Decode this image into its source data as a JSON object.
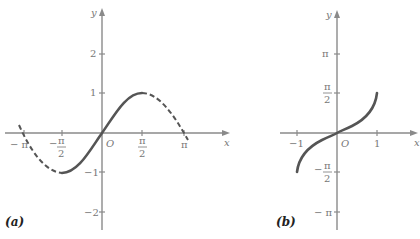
{
  "panels": [
    {
      "id": "a",
      "label": "(a)",
      "axes": {
        "x_label": "x",
        "y_label": "y",
        "origin_label": "O"
      },
      "x_ticks": [
        "-π",
        "-π/2",
        "π/2",
        "π"
      ],
      "y_ticks": [
        "2",
        "1",
        "-1",
        "-2"
      ],
      "curve": "y = sin x (solid on [-π/2, π/2], dashed elsewhere)"
    },
    {
      "id": "b",
      "label": "(b)",
      "axes": {
        "x_label": "x",
        "y_label": "y",
        "origin_label": "O"
      },
      "x_ticks": [
        "-1",
        "1"
      ],
      "y_ticks": [
        "π",
        "π/2",
        "-π/2",
        "-π"
      ],
      "curve": "y = arcsin x on [-1, 1]"
    }
  ],
  "text": {
    "a_label": "(a)",
    "b_label": "(b)",
    "x": "x",
    "y": "y",
    "O": "O",
    "a_xt_negpi": "− π",
    "a_xt_negpi2_n": "π",
    "a_xt_negpi2_d": "2",
    "a_xt_pi2_n": "π",
    "a_xt_pi2_d": "2",
    "a_xt_pi": "π",
    "a_yt_2": "2",
    "a_yt_1": "1",
    "a_yt_m1": "−1",
    "a_yt_m2": "−2",
    "b_xt_m1": "−1",
    "b_xt_1": "1",
    "b_yt_pi": "π",
    "b_yt_pi2_n": "π",
    "b_yt_pi2_d": "2",
    "b_yt_mpi2_n": "π",
    "b_yt_mpi2_d": "2",
    "b_yt_mpi": "− π"
  },
  "colors": {
    "curve": "#555555",
    "axes": "#8a8a8a"
  }
}
